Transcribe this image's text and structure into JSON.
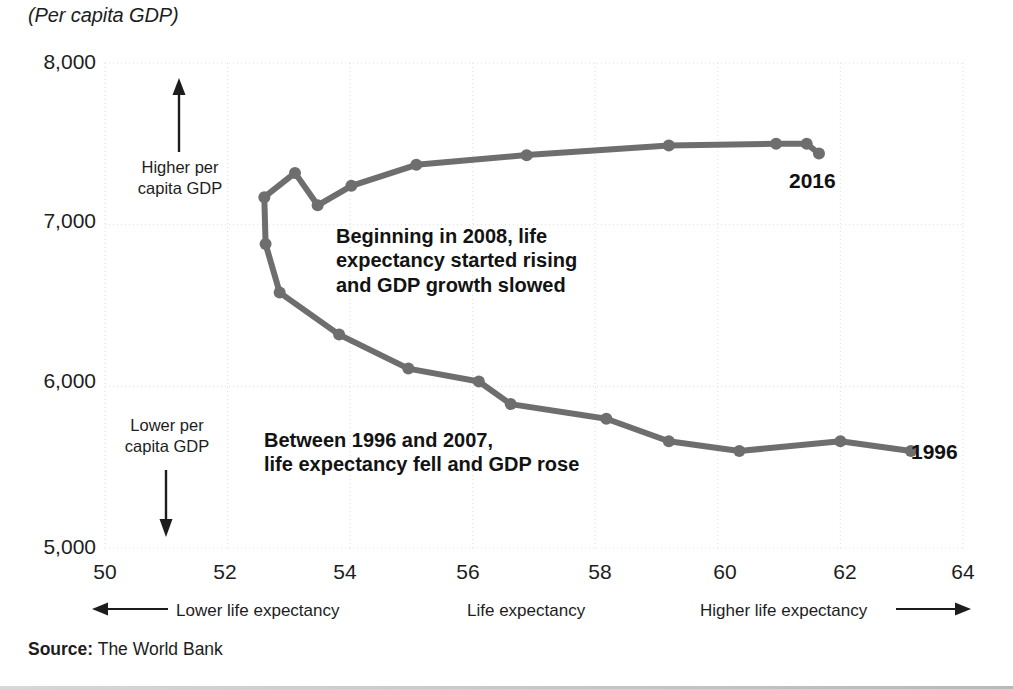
{
  "title": "(Per capita GDP)",
  "source": {
    "prefix": "Source:",
    "text": " The World Bank"
  },
  "axis": {
    "y_ticks": [
      "8,000",
      "7,000",
      "6,000",
      "5,000"
    ],
    "x_ticks": [
      "50",
      "52",
      "54",
      "56",
      "58",
      "60",
      "62",
      "64"
    ],
    "x_center_label": "Life expectancy",
    "x_left_label": "Lower life expectancy",
    "x_right_label": "Higher life expectancy"
  },
  "direction_labels": {
    "up": "Higher per\ncapita GDP",
    "down": "Lower per\ncapita GDP"
  },
  "annotations": {
    "upper": "Beginning in 2008, life\nexpectancy started rising\nand GDP growth slowed",
    "lower": "Between 1996 and 2007,\nlife expectancy fell and GDP rose"
  },
  "endpoints": {
    "start": "1996",
    "end": "2016"
  },
  "colors": {
    "line": "#6e6e6e",
    "text": "#1d1d1d",
    "grid": "#e2e2e2",
    "background": "#ffffff"
  },
  "chart_data": {
    "type": "line",
    "title": "(Per capita GDP)",
    "xlabel": "Life expectancy",
    "ylabel": "Per capita GDP",
    "xlim": [
      50,
      64
    ],
    "ylim": [
      5000,
      8000
    ],
    "xticks": [
      50,
      52,
      54,
      56,
      58,
      60,
      62,
      64
    ],
    "yticks": [
      5000,
      6000,
      7000,
      8000
    ],
    "grid": true,
    "legend": "none",
    "series": [
      {
        "name": "Per capita GDP vs life expectancy (1996-2016)",
        "points": [
          {
            "year": 1996,
            "x": 63.15,
            "y": 5600
          },
          {
            "year": 1997,
            "x": 62.0,
            "y": 5660
          },
          {
            "year": 1998,
            "x": 60.35,
            "y": 5600
          },
          {
            "year": 1999,
            "x": 59.2,
            "y": 5660
          },
          {
            "year": 2000,
            "x": 58.18,
            "y": 5800
          },
          {
            "year": 2001,
            "x": 56.62,
            "y": 5890
          },
          {
            "year": 2002,
            "x": 56.1,
            "y": 6030
          },
          {
            "year": 2003,
            "x": 54.95,
            "y": 6110
          },
          {
            "year": 2004,
            "x": 53.82,
            "y": 6320
          },
          {
            "year": 2005,
            "x": 52.85,
            "y": 6580
          },
          {
            "year": 2006,
            "x": 52.62,
            "y": 6880
          },
          {
            "year": 2007,
            "x": 52.6,
            "y": 7170
          },
          {
            "year": 2008,
            "x": 53.1,
            "y": 7320
          },
          {
            "year": 2009,
            "x": 53.47,
            "y": 7120
          },
          {
            "year": 2010,
            "x": 54.02,
            "y": 7240
          },
          {
            "year": 2011,
            "x": 55.08,
            "y": 7370
          },
          {
            "year": 2012,
            "x": 56.88,
            "y": 7430
          },
          {
            "year": 2013,
            "x": 59.2,
            "y": 7490
          },
          {
            "year": 2014,
            "x": 60.95,
            "y": 7500
          },
          {
            "year": 2015,
            "x": 61.45,
            "y": 7500
          },
          {
            "year": 2016,
            "x": 61.65,
            "y": 7440
          }
        ]
      }
    ]
  }
}
